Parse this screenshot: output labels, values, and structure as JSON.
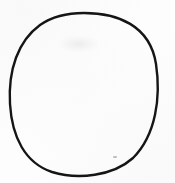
{
  "figure": {
    "title": "hand-drawn circle",
    "shape_kind": "circle",
    "stroke_color": "#151515",
    "fill_color": "none",
    "background_color": "#fdfdfd",
    "stroke_width_px": 2.4,
    "center_x": 84,
    "center_y": 94,
    "radius_x": 74,
    "radius_y": 81,
    "bounds": {
      "left": 10,
      "top": 13,
      "right": 158,
      "bottom": 175,
      "width": 148,
      "height": 162
    },
    "canvas": {
      "width": 175,
      "height": 183
    },
    "path": "M 84 13 C 117 13 150 25 156 64 C 161 97 156 135 133 158 C 113 176 78 180 52 172 C 25 163 12 137 10 104 C 8 70 18 41 40 25 C 53 16 68 13 84 13 Z",
    "artifacts": [
      {
        "name": "faint-smudge",
        "x": 60,
        "y": 36,
        "width": 38,
        "height": 16,
        "color": "#d9d9d9"
      },
      {
        "name": "speck",
        "x": 113,
        "y": 156,
        "width": 4,
        "height": 2,
        "color": "#8c8c8c"
      }
    ]
  }
}
